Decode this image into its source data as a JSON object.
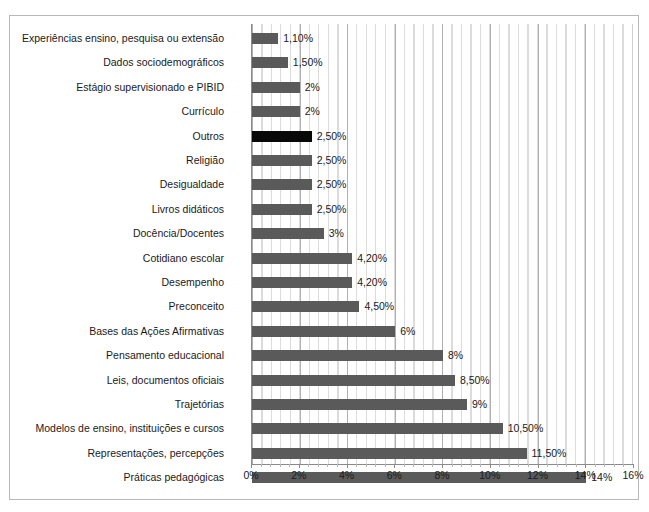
{
  "chart_data": {
    "type": "bar",
    "orientation": "horizontal",
    "title": "",
    "subtitle": "",
    "xlabel": "",
    "ylabel": "",
    "xlim": [
      0,
      16
    ],
    "xtick_labels": [
      "0%",
      "2%",
      "4%",
      "6%",
      "8%",
      "10%",
      "12%",
      "14%",
      "16%"
    ],
    "xticks": [
      0,
      2,
      4,
      6,
      8,
      10,
      12,
      14,
      16
    ],
    "grid": "vertical-major-and-minor",
    "legend": "none",
    "bar_color": "#5a5a5a",
    "highlight_color": "#080808",
    "categories": [
      "Experiências ensino, pesquisa ou extensão",
      "Dados sociodemográficos",
      "Estágio supervisionado e PIBID",
      "Currículo",
      "Outros",
      "Religião",
      "Desigualdade",
      "Livros didáticos",
      "Docência/Docentes",
      "Cotidiano escolar",
      "Desempenho",
      "Preconceito",
      "Bases das Ações Afirmativas",
      "Pensamento educacional",
      "Leis, documentos oficiais",
      "Trajetórias",
      "Modelos de ensino, instituições e cursos",
      "Representações, percepções",
      "Práticas pedagógicas"
    ],
    "values": [
      1.1,
      1.5,
      2,
      2,
      2.5,
      2.5,
      2.5,
      2.5,
      3,
      4.2,
      4.2,
      4.5,
      6,
      8,
      8.5,
      9,
      10.5,
      11.5,
      14
    ],
    "value_labels": [
      "1,10%",
      "1,50%",
      "2%",
      "2%",
      "2,50%",
      "2,50%",
      "2,50%",
      "2,50%",
      "3%",
      "4,20%",
      "4,20%",
      "4,50%",
      "6%",
      "8%",
      "8,50%",
      "9%",
      "10,50%",
      "11,50%",
      "14%"
    ],
    "highlighted": [
      "Outros"
    ],
    "bars": [
      {
        "category": "Experiências ensino, pesquisa ou extensão",
        "value": 1.1,
        "label": "1,10%",
        "highlight": false
      },
      {
        "category": "Dados sociodemográficos",
        "value": 1.5,
        "label": "1,50%",
        "highlight": false
      },
      {
        "category": "Estágio supervisionado e PIBID",
        "value": 2,
        "label": "2%",
        "highlight": false
      },
      {
        "category": "Currículo",
        "value": 2,
        "label": "2%",
        "highlight": false
      },
      {
        "category": "Outros",
        "value": 2.5,
        "label": "2,50%",
        "highlight": true
      },
      {
        "category": "Religião",
        "value": 2.5,
        "label": "2,50%",
        "highlight": false
      },
      {
        "category": "Desigualdade",
        "value": 2.5,
        "label": "2,50%",
        "highlight": false
      },
      {
        "category": "Livros didáticos",
        "value": 2.5,
        "label": "2,50%",
        "highlight": false
      },
      {
        "category": "Docência/Docentes",
        "value": 3,
        "label": "3%",
        "highlight": false
      },
      {
        "category": "Cotidiano escolar",
        "value": 4.2,
        "label": "4,20%",
        "highlight": false
      },
      {
        "category": "Desempenho",
        "value": 4.2,
        "label": "4,20%",
        "highlight": false
      },
      {
        "category": "Preconceito",
        "value": 4.5,
        "label": "4,50%",
        "highlight": false
      },
      {
        "category": "Bases das Ações Afirmativas",
        "value": 6,
        "label": "6%",
        "highlight": false
      },
      {
        "category": "Pensamento educacional",
        "value": 8,
        "label": "8%",
        "highlight": false
      },
      {
        "category": "Leis, documentos oficiais",
        "value": 8.5,
        "label": "8,50%",
        "highlight": false
      },
      {
        "category": "Trajetórias",
        "value": 9,
        "label": "9%",
        "highlight": false
      },
      {
        "category": "Modelos de ensino, instituições e cursos",
        "value": 10.5,
        "label": "10,50%",
        "highlight": false
      },
      {
        "category": "Representações, percepções",
        "value": 11.5,
        "label": "11,50%",
        "highlight": false
      },
      {
        "category": "Práticas pedagógicas",
        "value": 14,
        "label": "14%",
        "highlight": false
      }
    ]
  }
}
